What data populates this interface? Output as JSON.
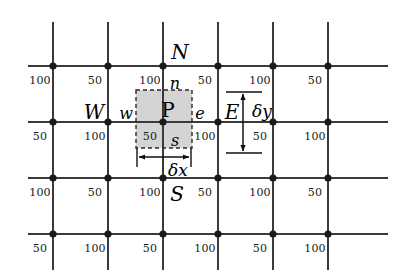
{
  "figure": {
    "width": 407,
    "height": 278,
    "background_color": "#ffffff",
    "grid_line_color": "#3a3a3a",
    "node_color": "#1a1a1a",
    "control_volume_fill": "#d2d2d2",
    "control_volume_border": "#2a2a2a"
  },
  "grid": {
    "vertical_lines_x": [
      53,
      108,
      163,
      218,
      273,
      328
    ],
    "vertical_line_top": 22,
    "vertical_line_bottom": 270,
    "horizontal_lines_y": [
      66,
      122,
      178,
      234
    ],
    "horizontal_line_left": 28,
    "horizontal_line_right": 388,
    "node_radius": 3.6
  },
  "cell_values": {
    "rows": [
      {
        "label_y": 82,
        "values": [
          "100",
          "50",
          "100",
          "50",
          "100",
          "50"
        ],
        "x_positions": [
          40,
          95,
          150,
          205,
          260,
          315
        ]
      },
      {
        "label_y": 138,
        "values": [
          "50",
          "100",
          "50",
          "100",
          "50",
          "100"
        ],
        "x_positions": [
          40,
          95,
          150,
          205,
          260,
          315
        ]
      },
      {
        "label_y": 194,
        "values": [
          "100",
          "50",
          "100",
          "50",
          "100",
          "50"
        ],
        "x_positions": [
          40,
          95,
          150,
          205,
          260,
          315
        ]
      },
      {
        "label_y": 250,
        "values": [
          "50",
          "100",
          "50",
          "100",
          "50",
          "100"
        ],
        "x_positions": [
          40,
          95,
          150,
          205,
          260,
          315
        ]
      }
    ]
  },
  "control_volume": {
    "x": 136,
    "y": 90,
    "width": 56,
    "height": 58,
    "center_node_x": 163,
    "center_node_y": 122
  },
  "labels": {
    "north": "N",
    "south": "S",
    "east": "E",
    "west": "W",
    "face_north": "n",
    "face_south": "s",
    "face_east": "e",
    "face_west": "w",
    "center": "P",
    "delta_x": "δx",
    "delta_y": "δy"
  },
  "label_positions": {
    "north": {
      "x": 180,
      "y": 52
    },
    "south": {
      "x": 177,
      "y": 194
    },
    "east": {
      "x": 232,
      "y": 112
    },
    "west": {
      "x": 94,
      "y": 112
    },
    "face_north": {
      "x": 175,
      "y": 84
    },
    "face_south": {
      "x": 175,
      "y": 141
    },
    "face_east": {
      "x": 200,
      "y": 114
    },
    "face_west": {
      "x": 126,
      "y": 114
    },
    "center": {
      "x": 168,
      "y": 110
    },
    "delta_x": {
      "x": 178,
      "y": 170
    },
    "delta_y": {
      "x": 262,
      "y": 111
    }
  },
  "dimensions": {
    "delta_x_arrow": {
      "x1": 138,
      "x2": 190,
      "y": 157
    },
    "delta_x_extension_left": {
      "x": 137,
      "y1": 148,
      "y2": 167
    },
    "delta_x_extension_right": {
      "x": 191,
      "y1": 148,
      "y2": 167
    },
    "delta_y_arrow": {
      "x": 243,
      "y1": 93,
      "y2": 152
    },
    "delta_y_tick_top": {
      "x1": 226,
      "x2": 262,
      "y": 92
    },
    "delta_y_tick_bottom": {
      "x1": 226,
      "x2": 262,
      "y": 153
    }
  }
}
